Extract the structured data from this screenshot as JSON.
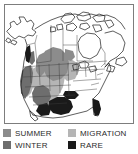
{
  "figure": {
    "panel_border_color": "#7d7d7d",
    "background_color": "#ffffff"
  },
  "map": {
    "name": "north-america-range-map",
    "outline_color": "#1a1a1a",
    "land_fill": "#ffffff",
    "regions": [
      {
        "name": "summer-range",
        "category": "SUMMER",
        "color": "#8c8c8c"
      },
      {
        "name": "migration-range",
        "category": "MIGRATION",
        "color": "#b5b5b5"
      },
      {
        "name": "winter-range",
        "category": "WINTER",
        "color": "#6e6e6e"
      },
      {
        "name": "rare-range",
        "category": "RARE",
        "color": "#1a1a1a"
      }
    ]
  },
  "legend": {
    "items": [
      {
        "label": "SUMMER",
        "color": "#8c8c8c"
      },
      {
        "label": "MIGRATION",
        "color": "#b5b5b5"
      },
      {
        "label": "WINTER",
        "color": "#6e6e6e"
      },
      {
        "label": "RARE",
        "color": "#1a1a1a"
      }
    ]
  }
}
